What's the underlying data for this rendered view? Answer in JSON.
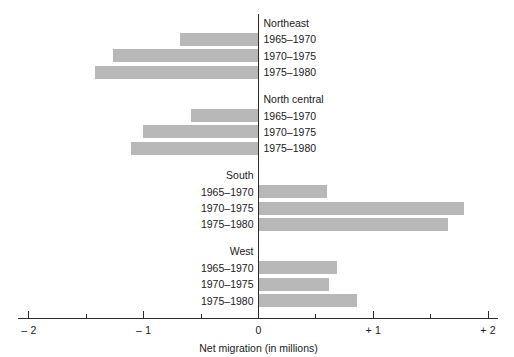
{
  "chart_data": {
    "type": "bar",
    "orientation": "horizontal",
    "title": "",
    "xlabel": "Net migration (in millions)",
    "ylabel": "",
    "xlim": [
      -2,
      2
    ],
    "grid": false,
    "legend": null,
    "zero_line": true,
    "tick_labels": [
      "– 2",
      "– 1",
      "0",
      "+ 1",
      "+ 2"
    ],
    "tick_values": [
      -2,
      -1,
      0,
      1,
      2
    ],
    "minor_tick_values": [
      -1.5,
      -0.5,
      0.5,
      1.5
    ],
    "bar_color": "#b8b8b8",
    "axis_color": "#2b2b2b",
    "groups": [
      {
        "name": "Northeast",
        "label_side": "right",
        "categories": [
          "1965–1970",
          "1970–1975",
          "1975–1980"
        ],
        "values": [
          -0.68,
          -1.27,
          -1.42
        ]
      },
      {
        "name": "North central",
        "label_side": "right",
        "categories": [
          "1965–1970",
          "1970–1975",
          "1975–1980"
        ],
        "values": [
          -0.59,
          -1.01,
          -1.11
        ]
      },
      {
        "name": "South",
        "label_side": "left",
        "categories": [
          "1965–1970",
          "1970–1975",
          "1975–1980"
        ],
        "values": [
          0.6,
          1.79,
          1.65
        ]
      },
      {
        "name": "West",
        "label_side": "left",
        "categories": [
          "1965–1970",
          "1970–1975",
          "1975–1980"
        ],
        "values": [
          0.68,
          0.61,
          0.86
        ]
      }
    ]
  }
}
